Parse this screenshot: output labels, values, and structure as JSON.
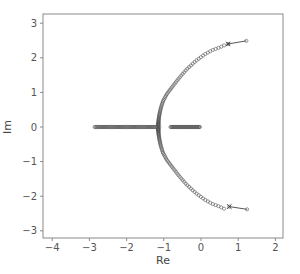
{
  "chart_data": {
    "type": "scatter",
    "title": "",
    "xlabel": "Re",
    "ylabel": "Im",
    "xlim": [
      -4.25,
      2.2
    ],
    "ylim": [
      -3.2,
      3.25
    ],
    "grid": false,
    "legend": null,
    "x_ticks": [
      -4,
      -3,
      -2,
      -1,
      0,
      1,
      2
    ],
    "y_ticks": [
      3,
      2,
      1,
      0,
      -1,
      -2,
      -3
    ],
    "x_tick_labels": [
      "-4",
      "-3",
      "-2",
      "-1",
      "0",
      "1",
      "2"
    ],
    "y_tick_labels": [
      "3",
      "2",
      "1",
      "0",
      "-1",
      "-2",
      "-3"
    ],
    "series": [
      {
        "name": "real-axis eigenvalues (left cluster)",
        "marker": "circle",
        "range_re": [
          -2.86,
          -1.12
        ],
        "im": 0,
        "count": 70
      },
      {
        "name": "real-axis eigenvalues (right cluster)",
        "marker": "circle",
        "range_re": [
          -0.82,
          -0.03
        ],
        "im": 0,
        "count": 40
      },
      {
        "name": "arc eigenvalues (upper)",
        "marker": "circle",
        "points": [
          [
            -1.15,
            0.05
          ],
          [
            -1.14,
            0.2
          ],
          [
            -1.12,
            0.35
          ],
          [
            -1.08,
            0.55
          ],
          [
            -1.02,
            0.75
          ],
          [
            -0.92,
            0.95
          ],
          [
            -0.78,
            1.15
          ],
          [
            -0.6,
            1.4
          ],
          [
            -0.4,
            1.65
          ],
          [
            -0.15,
            1.9
          ],
          [
            0.1,
            2.1
          ],
          [
            0.3,
            2.22
          ],
          [
            0.5,
            2.3
          ],
          [
            0.62,
            2.36
          ]
        ],
        "density": "dense near real axis, sparse near end"
      },
      {
        "name": "arc eigenvalues (lower)",
        "marker": "circle",
        "mirror_of": "arc eigenvalues (upper)"
      },
      {
        "name": "trajectory upper",
        "marker": "x-to-circle",
        "points": [
          [
            0.73,
            2.4
          ],
          [
            1.22,
            2.49
          ]
        ]
      },
      {
        "name": "trajectory lower",
        "marker": "x-to-circle",
        "points": [
          [
            0.76,
            -2.3
          ],
          [
            1.24,
            -2.38
          ]
        ]
      }
    ]
  }
}
